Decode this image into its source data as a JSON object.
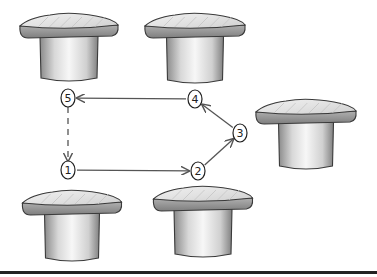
{
  "diagram": {
    "colors": {
      "ink": "#3a3a3a",
      "cap_top": "#e6e6e6",
      "cap_side": "#9a9a9a",
      "stem": "#f2f2f2",
      "stem_shade": "#8a8a8a",
      "baseline": "#222222"
    },
    "stools": [
      {
        "id": "stool-top-left",
        "cx": 69,
        "cap_top": 14,
        "cap_w": 98,
        "stem_w": 58,
        "stem_bottom": 82
      },
      {
        "id": "stool-top-center",
        "cx": 195,
        "cap_top": 14,
        "cap_w": 100,
        "stem_w": 57,
        "stem_bottom": 84
      },
      {
        "id": "stool-right",
        "cx": 306,
        "cap_top": 100,
        "cap_w": 100,
        "stem_w": 55,
        "stem_bottom": 170
      },
      {
        "id": "stool-bottom-left",
        "cx": 72,
        "cap_top": 191,
        "cap_w": 99,
        "stem_w": 55,
        "stem_bottom": 262
      },
      {
        "id": "stool-bottom-center",
        "cx": 203,
        "cap_top": 187,
        "cap_w": 99,
        "stem_w": 58,
        "stem_bottom": 258
      }
    ],
    "nodes": [
      {
        "label": "1",
        "x": 68,
        "y": 170
      },
      {
        "label": "2",
        "x": 198,
        "y": 171
      },
      {
        "label": "3",
        "x": 240,
        "y": 133
      },
      {
        "label": "4",
        "x": 195,
        "y": 99
      },
      {
        "label": "5",
        "x": 68,
        "y": 98
      }
    ],
    "edges": [
      {
        "from": "1",
        "to": "2",
        "style": "solid"
      },
      {
        "from": "2",
        "to": "3",
        "style": "solid"
      },
      {
        "from": "3",
        "to": "4",
        "style": "solid"
      },
      {
        "from": "4",
        "to": "5",
        "style": "solid"
      },
      {
        "from": "5",
        "to": "1",
        "style": "dashed"
      }
    ]
  }
}
